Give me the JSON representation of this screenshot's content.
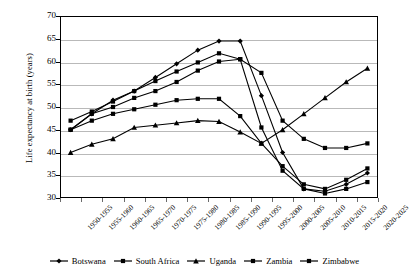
{
  "chart_data": {
    "type": "line",
    "title": "",
    "xlabel": "",
    "ylabel": "Life expectancy at birth (years)",
    "ylim": [
      30,
      70
    ],
    "ytick_step": 5,
    "yticks": [
      70,
      65,
      60,
      55,
      50,
      45,
      40,
      35,
      30
    ],
    "grid": true,
    "legend_position": "bottom",
    "categories": [
      "1950-1955",
      "1955-1960",
      "1960-1965",
      "1965-1970",
      "1970-1975",
      "1975-1980",
      "1980-1985",
      "1985-1990",
      "1990-1995",
      "1995-2000",
      "2000-2005",
      "2005-2010",
      "2010-2015",
      "2015-2020",
      "2020-2025"
    ],
    "series": [
      {
        "name": "Botswana",
        "marker": "diamond",
        "color": "#000000",
        "values": [
          45.0,
          48.5,
          51.5,
          53.5,
          56.5,
          59.5,
          62.5,
          64.5,
          64.5,
          52.5,
          40.0,
          32.0,
          31.5,
          33.0,
          35.5
        ]
      },
      {
        "name": "South Africa",
        "marker": "square",
        "color": "#000000",
        "values": [
          47.0,
          49.0,
          51.2,
          53.5,
          55.7,
          57.8,
          59.8,
          61.8,
          60.5,
          57.5,
          47.0,
          43.0,
          41.0,
          41.0,
          42.0
        ]
      },
      {
        "name": "Uganda",
        "marker": "triangle",
        "color": "#000000",
        "values": [
          40.0,
          41.8,
          43.0,
          45.5,
          46.0,
          46.5,
          47.0,
          46.8,
          44.5,
          42.0,
          45.0,
          48.5,
          52.0,
          55.5,
          58.5
        ]
      },
      {
        "name": "Zambia",
        "marker": "square",
        "color": "#000000",
        "values": [
          45.0,
          47.0,
          48.5,
          49.5,
          50.5,
          51.5,
          51.8,
          51.8,
          48.0,
          42.0,
          37.0,
          33.0,
          32.0,
          34.0,
          36.5
        ]
      },
      {
        "name": "Zimbabwe",
        "marker": "square",
        "color": "#000000",
        "values": [
          45.0,
          48.5,
          50.0,
          52.0,
          53.5,
          55.5,
          58.0,
          60.0,
          60.5,
          45.5,
          36.0,
          32.0,
          31.0,
          32.0,
          33.5
        ]
      }
    ]
  },
  "axis": {
    "y_title": "Life expectancy at birth (years)"
  }
}
